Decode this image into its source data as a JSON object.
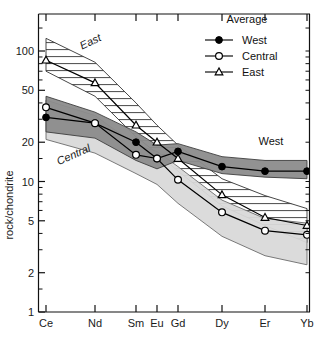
{
  "chart_data": {
    "type": "line",
    "title": "",
    "xlabel": "",
    "ylabel": "rock/chondrite",
    "categories": [
      "Ce",
      "Nd",
      "Sm",
      "Eu",
      "Gd",
      "Dy",
      "Er",
      "Yb"
    ],
    "yscale": "log",
    "ylim": [
      1,
      150
    ],
    "yticks": [
      1,
      2,
      5,
      10,
      20,
      50,
      100
    ],
    "ytick_labels": [
      "1",
      "2",
      "5",
      "10",
      "20",
      "50",
      "100"
    ],
    "grid": false,
    "legend_position": "top-right",
    "legend_title": "Average",
    "series": [
      {
        "name": "West",
        "marker": "filled-circle",
        "color": "#000000",
        "values": [
          31,
          28,
          20,
          15,
          17,
          13,
          12,
          12
        ],
        "band_label": "West",
        "band_fill": "#8c8c8c",
        "band_upper": [
          45,
          34,
          24,
          19,
          19.5,
          15.5,
          14.5,
          14.5
        ],
        "band_lower": [
          24,
          21.5,
          14.5,
          12.5,
          14.5,
          11.5,
          10.8,
          10.5
        ]
      },
      {
        "name": "Central",
        "marker": "open-circle",
        "color": "#000000",
        "values": [
          37,
          28,
          16,
          15,
          10.3,
          5.8,
          4.2,
          3.9
        ],
        "band_label": "Central",
        "band_fill": "#d9d9d9",
        "band_upper": [
          42,
          32,
          19,
          17,
          13,
          7.2,
          5.2,
          4.8
        ],
        "band_lower": [
          21,
          16.5,
          11.5,
          9.5,
          6.8,
          3.8,
          2.7,
          2.3
        ]
      },
      {
        "name": "East",
        "marker": "open-triangle",
        "color": "#000000",
        "values": [
          85,
          57,
          27,
          20,
          15,
          7.9,
          5.3,
          4.6
        ],
        "band_label": "East",
        "band_fill": "hatched",
        "band_upper": [
          125,
          82,
          40,
          27,
          19,
          10.5,
          7.8,
          6.2
        ],
        "band_lower": [
          70,
          45,
          22,
          16.5,
          12,
          6.5,
          4.6,
          3.4
        ]
      }
    ],
    "annotations": [
      {
        "text": "East",
        "x_pos": 92,
        "y_pos": 45,
        "style": "italic",
        "rotation": -26
      },
      {
        "text": "Central",
        "x_pos": 75,
        "y_pos": 158,
        "style": "italic",
        "rotation": -24
      },
      {
        "text": "West",
        "x_pos": 271,
        "y_pos": 145,
        "style": "plain",
        "rotation": 0
      }
    ]
  },
  "legend": {
    "title": "Average",
    "entries": [
      {
        "label": "West",
        "marker": "filled-circle"
      },
      {
        "label": "Central",
        "marker": "open-circle"
      },
      {
        "label": "East",
        "marker": "open-triangle"
      }
    ]
  },
  "axes": {
    "y_title": "rock/chondrite",
    "y_ticks": [
      "100",
      "50",
      "20",
      "10",
      "5",
      "2",
      "1"
    ],
    "x_ticks": [
      "Ce",
      "Nd",
      "Sm",
      "Eu",
      "Gd",
      "Dy",
      "Er",
      "Yb"
    ]
  }
}
